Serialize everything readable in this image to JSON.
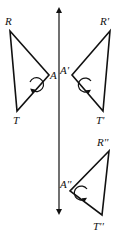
{
  "diagram": {
    "type": "geometric-transformation",
    "axis": {
      "x": 59,
      "y1": 8,
      "y2": 212,
      "arrows": "both"
    },
    "triangles": [
      {
        "name": "original",
        "points": {
          "R": [
            10,
            31
          ],
          "A": [
            49,
            75
          ],
          "T": [
            17,
            111
          ]
        },
        "labels": {
          "R": "R",
          "A": "A",
          "T": "T"
        },
        "orientation": "clockwise"
      },
      {
        "name": "reflection",
        "points": {
          "R": [
            110,
            31
          ],
          "A": [
            72,
            75
          ],
          "T": [
            103,
            111
          ]
        },
        "labels": {
          "R": "R'",
          "A": "A'",
          "T": "T'"
        },
        "orientation": "counterclockwise"
      },
      {
        "name": "translation",
        "points": {
          "R": [
            109,
            151
          ],
          "A": [
            70,
            191
          ],
          "T": [
            102,
            215
          ]
        },
        "labels": {
          "R": "R''",
          "A": "A''",
          "T": "T''"
        },
        "orientation": "counterclockwise"
      }
    ]
  }
}
